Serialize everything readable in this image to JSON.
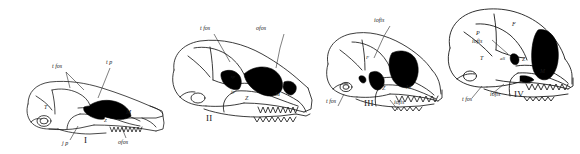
{
  "figure": {
    "type": "comparative-anatomy-plate",
    "background_color": "#ffffff",
    "line_color": "#1a1a1a",
    "fill_color": "#000000"
  },
  "specimens": [
    {
      "numeral": "I",
      "labels": [
        {
          "text": "t fos"
        },
        {
          "text": "t p"
        },
        {
          "text": "T"
        },
        {
          "text": "Z"
        },
        {
          "text": "M"
        },
        {
          "text": "j p"
        },
        {
          "text": "ofos"
        }
      ]
    },
    {
      "numeral": "II",
      "labels": [
        {
          "text": "t fos"
        },
        {
          "text": "ofos"
        },
        {
          "text": "tp"
        },
        {
          "text": "jp"
        },
        {
          "text": "Z"
        },
        {
          "text": "M"
        }
      ]
    },
    {
      "numeral": "III",
      "labels": [
        {
          "text": "iofis"
        },
        {
          "text": "iofis"
        },
        {
          "text": "t fos"
        },
        {
          "text": "F"
        },
        {
          "text": "Z"
        },
        {
          "text": "M"
        }
      ]
    },
    {
      "numeral": "IV",
      "labels": [
        {
          "text": "P"
        },
        {
          "text": "F"
        },
        {
          "text": "iofis"
        },
        {
          "text": "T"
        },
        {
          "text": "aS"
        },
        {
          "text": "Z"
        },
        {
          "text": "M"
        },
        {
          "text": "iofis"
        },
        {
          "text": "t fos"
        }
      ]
    }
  ]
}
